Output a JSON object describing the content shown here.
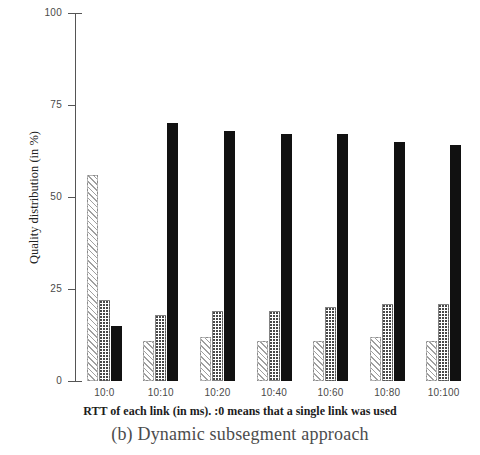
{
  "figure": {
    "caption": "(b) Dynamic subsegment approach"
  },
  "chart_data": {
    "type": "bar",
    "title": "",
    "subtitle": "",
    "xlabel": "RTT of each link (in ms). :0 means that a single link was used",
    "ylabel": "Quality distribution (in %)",
    "categories": [
      "10:0",
      "10:10",
      "10:20",
      "10:40",
      "10:60",
      "10:80",
      "10:100"
    ],
    "ylim": [
      0,
      100
    ],
    "yticks": [
      0,
      25,
      50,
      75,
      100
    ],
    "ytick_labels": [
      "0",
      "25",
      "50",
      "75",
      "100"
    ],
    "grid": false,
    "legend": "none",
    "series": [
      {
        "name": "low-quality",
        "fill": "hatched-diagonal",
        "color": "#ffffff",
        "values": [
          56,
          11,
          12,
          11,
          11,
          12,
          11
        ]
      },
      {
        "name": "medium-quality",
        "fill": "dotted-stipple",
        "color": "#ffffff",
        "values": [
          22,
          18,
          19,
          19,
          20,
          21,
          21
        ]
      },
      {
        "name": "high-quality",
        "fill": "solid",
        "color": "#111111",
        "values": [
          15,
          70,
          68,
          67,
          67,
          65,
          64
        ]
      }
    ]
  }
}
